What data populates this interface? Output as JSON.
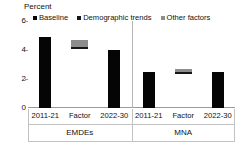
{
  "chart_data": {
    "type": "bar",
    "title": "",
    "ylabel": "Percent",
    "xlabel": "",
    "ylim": [
      0,
      6
    ],
    "yticks": [
      "0",
      "2",
      "4",
      "6"
    ],
    "grid": false,
    "legend_position": "top",
    "legend": [
      {
        "name": "Baseline",
        "color": "#050505"
      },
      {
        "name": "Demographic trends",
        "color": "#161616"
      },
      {
        "name": "Other factors",
        "color": "#8d8d8d"
      }
    ],
    "groups": [
      {
        "name": "EMDEs",
        "categories": [
          "2011-21",
          "Factor",
          "2022-30"
        ],
        "bars": [
          {
            "category": "2011-21",
            "series": "Baseline",
            "kind": "bar",
            "value": 4.9
          },
          {
            "category": "Factor",
            "kind": "floating-stack",
            "base": 4.05,
            "top": 4.72,
            "segments": [
              {
                "series": "Other factors",
                "from": 4.22,
                "to": 4.72
              },
              {
                "series": "Demographic trends",
                "from": 4.05,
                "to": 4.22
              }
            ]
          },
          {
            "category": "2022-30",
            "series": "Baseline",
            "kind": "bar",
            "value": 4.0
          }
        ]
      },
      {
        "name": "MNA",
        "categories": [
          "2011-21",
          "Factor",
          "2022-30"
        ],
        "bars": [
          {
            "category": "2011-21",
            "series": "Baseline",
            "kind": "bar",
            "value": 2.45
          },
          {
            "category": "Factor",
            "kind": "floating-stack",
            "base": 2.35,
            "top": 2.66,
            "segments": [
              {
                "series": "Other factors",
                "from": 2.5,
                "to": 2.66
              },
              {
                "series": "Demographic trends",
                "from": 2.35,
                "to": 2.5
              }
            ]
          },
          {
            "category": "2022-30",
            "series": "Baseline",
            "kind": "bar",
            "value": 2.5
          }
        ]
      }
    ]
  }
}
